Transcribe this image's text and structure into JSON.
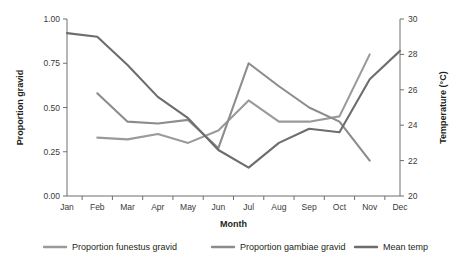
{
  "chart_data": {
    "type": "line",
    "title": "",
    "xlabel": "Month",
    "ylabel": "Proportion gravid",
    "y2label": "Temperature (°C)",
    "categories": [
      "Jan",
      "Feb",
      "Mar",
      "Apr",
      "May",
      "Jun",
      "Jul",
      "Aug",
      "Sep",
      "Oct",
      "Nov",
      "Dec"
    ],
    "ylim": [
      0.0,
      1.0
    ],
    "yticks": [
      "0.00",
      "0.25",
      "0.50",
      "0.75",
      "1.00"
    ],
    "ytick_values": [
      0.0,
      0.25,
      0.5,
      0.75,
      1.0
    ],
    "y2lim": [
      20,
      30
    ],
    "y2ticks": [
      "20",
      "22",
      "24",
      "26",
      "28",
      "30"
    ],
    "y2tick_values": [
      20,
      22,
      24,
      26,
      28,
      30
    ],
    "grid": false,
    "legend_position": "bottom",
    "series": [
      {
        "name": "Proportion funestus gravid",
        "axis": "left",
        "color": "#9a9a9a",
        "x": [
          "Feb",
          "Mar",
          "Apr",
          "May",
          "Jun",
          "Jul",
          "Aug",
          "Sep",
          "Oct",
          "Nov"
        ],
        "values": [
          0.33,
          0.32,
          0.35,
          0.3,
          0.37,
          0.54,
          0.42,
          0.42,
          0.45,
          0.8
        ]
      },
      {
        "name": "Proportion gambiae gravid",
        "axis": "left",
        "color": "#8c8c8c",
        "x": [
          "Feb",
          "Mar",
          "Apr",
          "May",
          "Jun",
          "Jul",
          "Aug",
          "Sep",
          "Oct",
          "Nov"
        ],
        "values": [
          0.58,
          0.42,
          0.41,
          0.43,
          0.27,
          0.75,
          0.62,
          0.5,
          0.42,
          0.2
        ]
      },
      {
        "name": "Mean temp",
        "axis": "right",
        "color": "#6d6d6d",
        "x": [
          "Jan",
          "Feb",
          "Mar",
          "Apr",
          "May",
          "Jun",
          "Jul",
          "Aug",
          "Sep",
          "Oct",
          "Nov",
          "Dec"
        ],
        "values": [
          29.2,
          29.0,
          27.4,
          25.6,
          24.4,
          22.6,
          21.6,
          23.0,
          23.8,
          23.6,
          26.6,
          28.2
        ]
      }
    ],
    "legend": [
      {
        "label": "Proportion funestus gravid",
        "color": "#9a9a9a"
      },
      {
        "label": "Proportion gambiae gravid",
        "color": "#8c8c8c"
      },
      {
        "label": "Mean temp",
        "color": "#6d6d6d"
      }
    ]
  }
}
